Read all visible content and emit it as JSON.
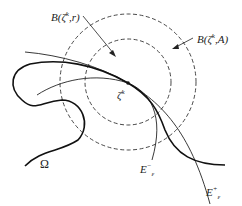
{
  "figure": {
    "labels": {
      "inner_ball": {
        "prefix": "B(ζ",
        "sup": "k",
        "suffix": ",r)"
      },
      "outer_ball": {
        "prefix": "B(ζ",
        "sup": "k",
        "suffix": ",A)"
      },
      "point": {
        "base": "ζ",
        "sup": "k"
      },
      "domain": "Ω",
      "e_minus": {
        "base": "E",
        "sup": "−",
        "sub": "ε"
      },
      "e_plus": {
        "base": "E",
        "sup": "+",
        "sub": "ε"
      }
    },
    "circles": {
      "inner": {
        "cx": 128,
        "cy": 82,
        "r": 43,
        "style": "dashed"
      },
      "outer": {
        "cx": 128,
        "cy": 82,
        "r": 68,
        "style": "dashed"
      }
    },
    "point_center": {
      "x": 128,
      "y": 83
    },
    "colors": {
      "stroke": "#222222",
      "background": "#ffffff"
    }
  }
}
